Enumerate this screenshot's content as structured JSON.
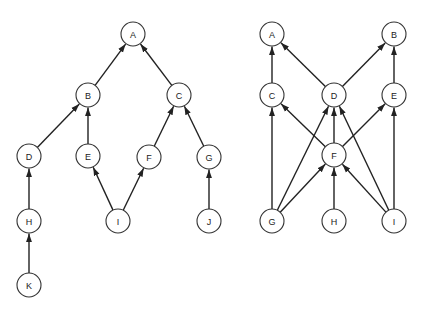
{
  "style": {
    "line_color": "#222222",
    "node_stroke": "#333333",
    "node_fill": "#ffffff",
    "node_radius": 12
  },
  "diagrams": [
    {
      "name": "left-graph",
      "nodes": [
        {
          "id": "A",
          "label": "A",
          "x": 133,
          "y": 34
        },
        {
          "id": "B",
          "label": "B",
          "x": 88,
          "y": 95
        },
        {
          "id": "C",
          "label": "C",
          "x": 179,
          "y": 95
        },
        {
          "id": "D",
          "label": "D",
          "x": 29,
          "y": 156
        },
        {
          "id": "E",
          "label": "E",
          "x": 88,
          "y": 156
        },
        {
          "id": "F",
          "label": "F",
          "x": 149,
          "y": 157
        },
        {
          "id": "G",
          "label": "G",
          "x": 209,
          "y": 157
        },
        {
          "id": "H",
          "label": "H",
          "x": 29,
          "y": 221
        },
        {
          "id": "I",
          "label": "I",
          "x": 118,
          "y": 221
        },
        {
          "id": "J",
          "label": "J",
          "x": 209,
          "y": 221
        },
        {
          "id": "K",
          "label": "K",
          "x": 29,
          "y": 285
        }
      ],
      "edges": [
        {
          "from": "B",
          "to": "A"
        },
        {
          "from": "C",
          "to": "A"
        },
        {
          "from": "D",
          "to": "B"
        },
        {
          "from": "E",
          "to": "B"
        },
        {
          "from": "F",
          "to": "C"
        },
        {
          "from": "G",
          "to": "C"
        },
        {
          "from": "H",
          "to": "D"
        },
        {
          "from": "I",
          "to": "E"
        },
        {
          "from": "I",
          "to": "F"
        },
        {
          "from": "J",
          "to": "G"
        },
        {
          "from": "K",
          "to": "H"
        }
      ]
    },
    {
      "name": "right-graph",
      "nodes": [
        {
          "id": "A",
          "label": "A",
          "x": 272,
          "y": 34
        },
        {
          "id": "B",
          "label": "B",
          "x": 394,
          "y": 34
        },
        {
          "id": "C",
          "label": "C",
          "x": 272,
          "y": 95
        },
        {
          "id": "D",
          "label": "D",
          "x": 334,
          "y": 95
        },
        {
          "id": "E",
          "label": "E",
          "x": 394,
          "y": 95
        },
        {
          "id": "F",
          "label": "F",
          "x": 334,
          "y": 155
        },
        {
          "id": "G",
          "label": "G",
          "x": 272,
          "y": 221
        },
        {
          "id": "H",
          "label": "H",
          "x": 334,
          "y": 221
        },
        {
          "id": "I",
          "label": "I",
          "x": 394,
          "y": 221
        }
      ],
      "edges": [
        {
          "from": "C",
          "to": "A"
        },
        {
          "from": "D",
          "to": "A"
        },
        {
          "from": "D",
          "to": "B"
        },
        {
          "from": "E",
          "to": "B"
        },
        {
          "from": "F",
          "to": "C"
        },
        {
          "from": "F",
          "to": "D"
        },
        {
          "from": "F",
          "to": "E"
        },
        {
          "from": "G",
          "to": "C"
        },
        {
          "from": "G",
          "to": "D"
        },
        {
          "from": "G",
          "to": "F"
        },
        {
          "from": "H",
          "to": "F"
        },
        {
          "from": "I",
          "to": "F"
        },
        {
          "from": "I",
          "to": "D"
        },
        {
          "from": "I",
          "to": "E"
        }
      ]
    }
  ]
}
